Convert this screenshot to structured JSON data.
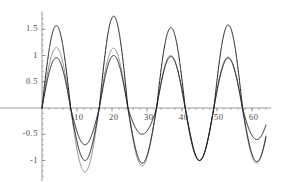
{
  "chart_data": {
    "type": "line",
    "title": "",
    "subtitle": "",
    "xlabel": "",
    "ylabel": "",
    "xlim": [
      0,
      64
    ],
    "ylim": [
      -1.3,
      1.8
    ],
    "grid": false,
    "legend": null,
    "legend_position": "none",
    "axis_style": "mathematica-crossed-axes",
    "axis_origin": [
      0,
      0
    ],
    "xticks": [
      10,
      20,
      30,
      40,
      50,
      60
    ],
    "xtick_labels": [
      "10",
      "20",
      "30",
      "40",
      "50",
      "60"
    ],
    "yticks": [
      1.5,
      1,
      0.5,
      -0.5,
      -1
    ],
    "ytick_labels": [
      "1.5",
      "1",
      "0.5",
      "-0.5",
      "-1"
    ],
    "xtick_minor_step": 2,
    "ytick_minor_step": 0.1,
    "series": [
      {
        "name": "outer-curve",
        "color": "#1a1a1a",
        "width": 1.0,
        "peak_amplitude": 1.75,
        "trough_amplitude": -1.05,
        "peaks": [
          {
            "x": 4.6,
            "y": 1.57
          },
          {
            "x": 21.0,
            "y": 1.75
          },
          {
            "x": 37.0,
            "y": 1.53
          },
          {
            "x": 53.0,
            "y": 1.58
          }
        ],
        "troughs": [
          {
            "x": 13.0,
            "y": -0.7
          },
          {
            "x": 29.2,
            "y": -0.5
          },
          {
            "x": 45.3,
            "y": -1.0
          },
          {
            "x": 61.3,
            "y": -0.6
          }
        ],
        "zero_crossings": [
          0,
          9.4,
          17.2,
          25.3,
          33.2,
          41.3,
          49.2,
          57.3
        ]
      },
      {
        "name": "middle-gray-curve",
        "color": "#8a8a8a",
        "width": 1.0,
        "peak_amplitude": 1.15,
        "trough_amplitude": -1.22,
        "peaks": [
          {
            "x": 4.6,
            "y": 1.15
          },
          {
            "x": 21.0,
            "y": 1.14
          },
          {
            "x": 37.0,
            "y": 1.0
          },
          {
            "x": 53.0,
            "y": 0.97
          }
        ],
        "troughs": [
          {
            "x": 13.2,
            "y": -1.22
          },
          {
            "x": 29.4,
            "y": -1.1
          },
          {
            "x": 45.5,
            "y": -1.0
          },
          {
            "x": 61.5,
            "y": -1.05
          }
        ],
        "zero_crossings": [
          0,
          9.2,
          17.6,
          25.2,
          33.4,
          41.2,
          49.3,
          57.2
        ]
      },
      {
        "name": "inner-curve",
        "color": "#1a1a1a",
        "width": 1.0,
        "peak_amplitude": 1.0,
        "trough_amplitude": -1.05,
        "peaks": [
          {
            "x": 4.7,
            "y": 0.96
          },
          {
            "x": 21.0,
            "y": 1.0
          },
          {
            "x": 37.0,
            "y": 0.98
          },
          {
            "x": 53.0,
            "y": 0.95
          }
        ],
        "troughs": [
          {
            "x": 13.1,
            "y": -1.0
          },
          {
            "x": 29.3,
            "y": -1.05
          },
          {
            "x": 45.4,
            "y": -1.0
          },
          {
            "x": 61.4,
            "y": -1.02
          }
        ],
        "zero_crossings": [
          0,
          9.3,
          17.4,
          25.3,
          33.3,
          41.3,
          49.2,
          57.3
        ]
      }
    ]
  },
  "axes": {
    "axis_color": "#8f8f8f",
    "tick_color": "#8f8f8f",
    "label_color": "#4a4a4a"
  }
}
